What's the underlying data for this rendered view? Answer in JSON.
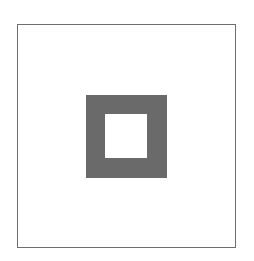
{
  "diagram": {
    "outer_frame": {
      "stroke": "#6e6e6e"
    },
    "square_ring": {
      "fill": "#6a6a6a",
      "hole_fill": "#ffffff"
    }
  }
}
